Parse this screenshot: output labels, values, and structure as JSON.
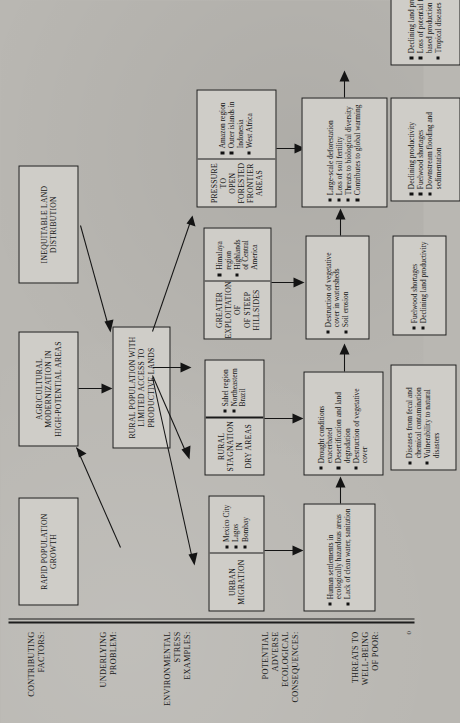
{
  "diagram": {
    "row_labels": [
      {
        "id": "contributing-factors",
        "text": "CONTRIBUTING\nFACTORS:"
      },
      {
        "id": "underlying-problem",
        "text": "UNDERLYING\nPROBLEM:"
      },
      {
        "id": "environmental-stress-examples",
        "text": "ENVIRONMENTAL\nSTRESS\nEXAMPLES:"
      },
      {
        "id": "potential-adverse-ecological-consequences",
        "text": "POTENTIAL\nADVERSE\nECOLOGICAL\nCONSEQUENCES:"
      },
      {
        "id": "threats-to-well-being-of-poor",
        "text": "THREATS TO\nWELL-BEING\nOF POOR:"
      }
    ],
    "boxes": {
      "rapid_population_growth": {
        "header": "RAPID POPULATION\nGROWTH",
        "bullets": []
      },
      "agricultural_modernization": {
        "header": "AGRICULTURAL\nMODERNIZATION IN\nHIGH-POTENTIAL AREAS",
        "bullets": []
      },
      "inequitable_land_distribution": {
        "header": "INEQUITABLE LAND\nDISTRIBUTION",
        "bullets": []
      },
      "rural_population_limited_access": {
        "header": "RURAL POPULATION WITH\nLIMITED ACCESS TO\nPRODUCTIVE LANDS",
        "bullets": []
      },
      "pressure_open_forested": {
        "header": "PRESSURE TO\nOPEN FORESTED\nFRONTIER AREAS",
        "bullets": [
          "Amazon region",
          "Outer islands in Indonesia",
          "West Africa"
        ]
      },
      "greater_exploitation_hillsides": {
        "header": "GREATER\nEXPLOITATION OF\nOF STEEP\nHILLSIDES",
        "bullets": [
          "Himalaya region",
          "Highlands of Central America"
        ]
      },
      "rural_stagnation_dry_areas": {
        "header": "RURAL\nSTAGNATION IN\nDRY AREAS",
        "bullets": [
          "Sahel region",
          "Northeastern Brazil"
        ]
      },
      "urban_migration": {
        "header": "URBAN\nMIGRATION",
        "bullets": [
          "Mexico City",
          "Lagos",
          "Bombay"
        ]
      },
      "forested_consequences": {
        "header": "",
        "bullets": [
          "Large-scale deforestation",
          "Loss of soil fertility",
          "Threats to biological diversity",
          "Contributes to global warming"
        ]
      },
      "hillside_consequences": {
        "header": "",
        "bullets": [
          "Destruction of vegetative cover in watersheds",
          "Soil erosion"
        ]
      },
      "dry_area_consequences": {
        "header": "",
        "bullets": [
          "Drought conditions exacerbated",
          "Desertification and land degradation",
          "Destruction of vegetative cover"
        ]
      },
      "urban_consequences": {
        "header": "",
        "bullets": [
          "Human settlements in ecologically hazardous areas",
          "Lack of clean water, sanitation"
        ]
      },
      "forested_threats": {
        "header": "",
        "bullets": [
          "Declining land productivity",
          "Loss of potential forest-based production",
          "Tropical diseases"
        ]
      },
      "hillside_threats": {
        "header": "",
        "bullets": [
          "Declining productivity",
          "Fuelwood shortages",
          "Downstream flooding and sedimentation"
        ]
      },
      "dry_area_threats": {
        "header": "",
        "bullets": [
          "Fuelwood shortages",
          "Declining land productivity"
        ]
      },
      "urban_threats": {
        "header": "",
        "bullets": [
          "Diseases from fecal and chemical contamination",
          "Vulnerability to natural disasters"
        ]
      }
    },
    "page_mark": "0",
    "colors": {
      "page_background": "#b9b7b2",
      "box_fill": "#cfcdc8",
      "ink": "#141414"
    }
  }
}
